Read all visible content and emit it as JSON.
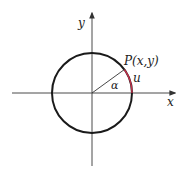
{
  "diagram": {
    "type": "unit-circle",
    "labels": {
      "x_axis": "x",
      "y_axis": "y",
      "point": "P(x,y)",
      "arc": "u",
      "angle": "α"
    },
    "colors": {
      "axes": "#4a4a4a",
      "circle": "#1a1a1a",
      "radius": "#333333",
      "arc": "#c0304a",
      "text": "#222222"
    }
  }
}
